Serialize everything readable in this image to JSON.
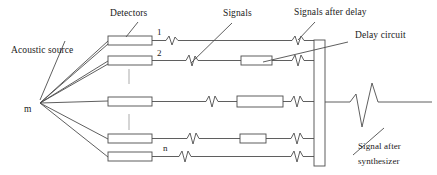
{
  "diagram": {
    "stroke_color": "#4d4d4d",
    "dash_color": "#b3b3b3",
    "text_color": "#1a1a1a",
    "background": "#ffffff",
    "labels": {
      "acoustic_source": "Acoustic source",
      "source_point": "m",
      "detectors": "Detectors",
      "signals": "Signals",
      "signals_after_delay": "Signals after delay",
      "delay_circuit": "Delay circuit",
      "signal_after_synth_line1": "Signal    after",
      "signal_after_synth_line2": "synthesizer",
      "channel_first": "1",
      "channel_second": "2",
      "channel_last": "n"
    },
    "channels": [
      {
        "index": "1",
        "y": 40,
        "detector": true,
        "delay_box": false
      },
      {
        "index": "2",
        "y": 60,
        "detector": true,
        "delay_box": true
      },
      {
        "index": "",
        "y": 101,
        "detector": true,
        "delay_box": true
      },
      {
        "index": "",
        "y": 139,
        "detector": true,
        "delay_box": true
      },
      {
        "index": "n",
        "y": 157,
        "detector": true,
        "delay_box": false
      }
    ],
    "counts": {
      "detector_rows": 5,
      "delay_boxes": 3,
      "signal_zigzags_per_row": 2
    },
    "geometry": {
      "source_x": 40,
      "source_y": 103,
      "detector_box_x": 108,
      "detector_box_width": 44,
      "detector_box_height": 9,
      "synthesizer_x": 314,
      "synthesizer_width": 11,
      "synthesizer_top": 40,
      "synthesizer_bottom": 166,
      "output_line_y": 102,
      "ellipsis_x": 129
    }
  }
}
